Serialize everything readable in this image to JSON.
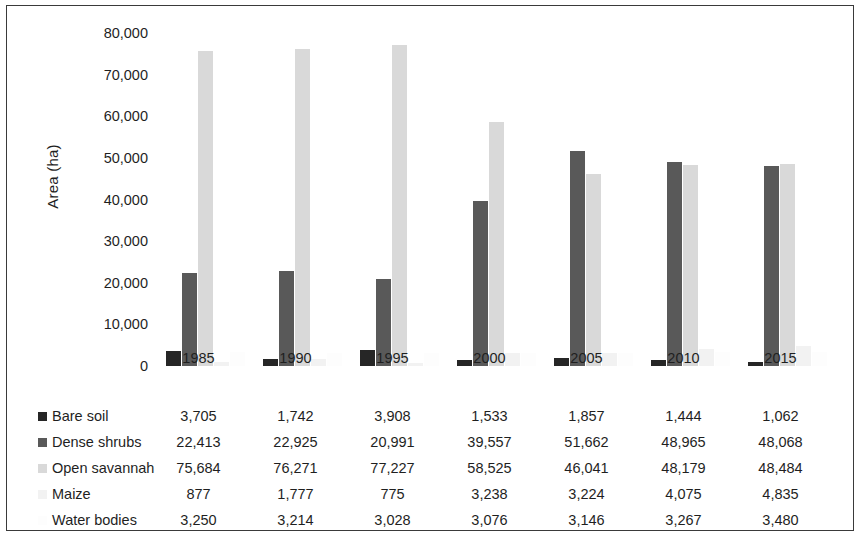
{
  "chart_data": {
    "type": "bar",
    "title": "",
    "xlabel": "",
    "ylabel": "Area (ha)",
    "ylim": [
      0,
      80000
    ],
    "ytick_labels": [
      "80,000",
      "70,000",
      "60,000",
      "50,000",
      "40,000",
      "30,000",
      "20,000",
      "10,000",
      "0"
    ],
    "ytick_values": [
      80000,
      70000,
      60000,
      50000,
      40000,
      30000,
      20000,
      10000,
      0
    ],
    "grid": false,
    "legend_position": "table-left",
    "categories": [
      "1985",
      "1990",
      "1995",
      "2000",
      "2005",
      "2010",
      "2015"
    ],
    "series": [
      {
        "name": "Bare soil",
        "color": "#262626",
        "values": [
          3705,
          1742,
          3908,
          1533,
          1857,
          1444,
          1062
        ],
        "labels": [
          "3,705",
          "1,742",
          "3,908",
          "1,533",
          "1,857",
          "1,444",
          "1,062"
        ]
      },
      {
        "name": "Dense shrubs",
        "color": "#595959",
        "values": [
          22413,
          22925,
          20991,
          39557,
          51662,
          48965,
          48068
        ],
        "labels": [
          "22,413",
          "22,925",
          "20,991",
          "39,557",
          "51,662",
          "48,965",
          "48,068"
        ]
      },
      {
        "name": "Open savannah",
        "color": "#d9d9d9",
        "values": [
          75684,
          76271,
          77227,
          58525,
          46041,
          48179,
          48484
        ],
        "labels": [
          "75,684",
          "76,271",
          "77,227",
          "58,525",
          "46,041",
          "48,179",
          "48,484"
        ]
      },
      {
        "name": "Maize",
        "color": "#f2f2f2",
        "values": [
          877,
          1777,
          775,
          3238,
          3224,
          4075,
          4835
        ],
        "labels": [
          "877",
          "1,777",
          "775",
          "3,238",
          "3,224",
          "4,075",
          "4,835"
        ]
      },
      {
        "name": "Water bodies",
        "color": "#fdfdfd",
        "values": [
          3250,
          3214,
          3028,
          3076,
          3146,
          3267,
          3480
        ],
        "labels": [
          "3,250",
          "3,214",
          "3,028",
          "3,076",
          "3,146",
          "3,267",
          "3,480"
        ]
      }
    ]
  }
}
